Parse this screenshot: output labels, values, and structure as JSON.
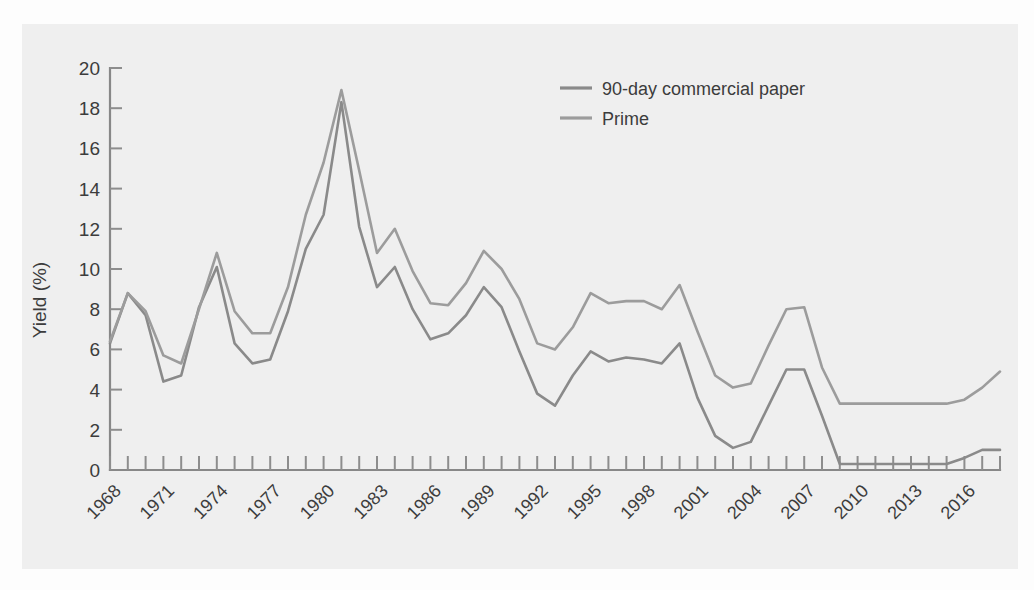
{
  "chart_data": {
    "type": "line",
    "title": "",
    "subtitle": "",
    "xlabel": "",
    "ylabel": "Yield (%)",
    "ylim": [
      0,
      20
    ],
    "xlim": [
      1968,
      2018
    ],
    "y_ticks": [
      0,
      2,
      4,
      6,
      8,
      10,
      12,
      14,
      16,
      18,
      20
    ],
    "x_tick_labels": [
      "1968",
      "1971",
      "1974",
      "1977",
      "1980",
      "1983",
      "1986",
      "1989",
      "1992",
      "1995",
      "1998",
      "2001",
      "2004",
      "2007",
      "2010",
      "2013",
      "2016"
    ],
    "x_tick_label_years": [
      1968,
      1971,
      1974,
      1977,
      1980,
      1983,
      1986,
      1989,
      1992,
      1995,
      1998,
      2001,
      2004,
      2007,
      2010,
      2013,
      2016
    ],
    "x_minor_tick_years": [
      1968,
      1969,
      1970,
      1971,
      1972,
      1973,
      1974,
      1975,
      1976,
      1977,
      1978,
      1979,
      1980,
      1981,
      1982,
      1983,
      1984,
      1985,
      1986,
      1987,
      1988,
      1989,
      1990,
      1991,
      1992,
      1993,
      1994,
      1995,
      1996,
      1997,
      1998,
      1999,
      2000,
      2001,
      2002,
      2003,
      2004,
      2005,
      2006,
      2007,
      2008,
      2009,
      2010,
      2011,
      2012,
      2013,
      2014,
      2015,
      2016,
      2017,
      2018
    ],
    "x_tick_label_rotation": -45,
    "grid": false,
    "legend_position": "top-center-right",
    "x": [
      1968,
      1969,
      1970,
      1971,
      1972,
      1973,
      1974,
      1975,
      1976,
      1977,
      1978,
      1979,
      1980,
      1981,
      1982,
      1983,
      1984,
      1985,
      1986,
      1987,
      1988,
      1989,
      1990,
      1991,
      1992,
      1993,
      1994,
      1995,
      1996,
      1997,
      1998,
      1999,
      2000,
      2001,
      2002,
      2003,
      2004,
      2005,
      2006,
      2007,
      2008,
      2009,
      2010,
      2011,
      2012,
      2013,
      2014,
      2015,
      2016,
      2017,
      2018
    ],
    "series": [
      {
        "name": "90-day commercial paper",
        "color": "#8a8a8a",
        "values": [
          6.3,
          8.8,
          7.7,
          4.4,
          4.7,
          8.1,
          10.1,
          6.3,
          5.3,
          5.5,
          7.9,
          11.0,
          12.7,
          18.3,
          12.1,
          9.1,
          10.1,
          8.0,
          6.5,
          6.8,
          7.7,
          9.1,
          8.1,
          5.9,
          3.8,
          3.2,
          4.7,
          5.9,
          5.4,
          5.6,
          5.5,
          5.3,
          6.3,
          3.6,
          1.7,
          1.1,
          1.4,
          3.2,
          5.0,
          5.0,
          2.7,
          0.3,
          0.3,
          0.3,
          0.3,
          0.3,
          0.3,
          0.3,
          0.6,
          1.0,
          1.0
        ]
      },
      {
        "name": "Prime",
        "color": "#9c9c9c",
        "values": [
          6.4,
          8.8,
          7.9,
          5.7,
          5.3,
          8.0,
          10.8,
          7.9,
          6.8,
          6.8,
          9.1,
          12.7,
          15.3,
          18.9,
          14.9,
          10.8,
          12.0,
          9.9,
          8.3,
          8.2,
          9.3,
          10.9,
          10.0,
          8.5,
          6.3,
          6.0,
          7.1,
          8.8,
          8.3,
          8.4,
          8.4,
          8.0,
          9.2,
          6.9,
          4.7,
          4.1,
          4.3,
          6.2,
          8.0,
          8.1,
          5.1,
          3.3,
          3.3,
          3.3,
          3.3,
          3.3,
          3.3,
          3.3,
          3.5,
          4.1,
          4.9
        ]
      }
    ]
  },
  "legend": {
    "entries": [
      {
        "label": "90-day commercial paper",
        "color": "#8a8a8a"
      },
      {
        "label": "Prime",
        "color": "#9c9c9c"
      }
    ]
  },
  "axes": {
    "y_axis_title": "Yield (%)"
  }
}
